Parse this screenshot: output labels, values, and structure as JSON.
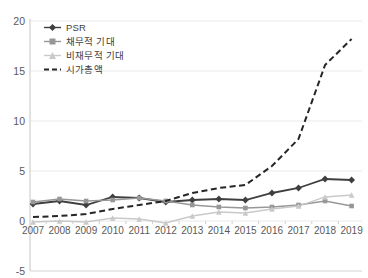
{
  "chart_data": {
    "type": "line",
    "title": "",
    "xlabel": "",
    "ylabel": "",
    "x": [
      2007,
      2008,
      2009,
      2010,
      2011,
      2012,
      2013,
      2014,
      2015,
      2016,
      2017,
      2018,
      2019
    ],
    "series": [
      {
        "name": "PSR",
        "marker": "diamond",
        "line_style": "solid",
        "color": "#3f3f3f",
        "values": [
          1.7,
          2.0,
          1.6,
          2.4,
          2.3,
          1.9,
          2.1,
          2.2,
          2.1,
          2.8,
          3.3,
          4.2,
          4.1
        ]
      },
      {
        "name": "채무적 기대",
        "marker": "square",
        "line_style": "solid",
        "color": "#979797",
        "values": [
          1.9,
          2.2,
          2.0,
          2.1,
          2.3,
          2.0,
          1.6,
          1.4,
          1.3,
          1.4,
          1.6,
          2.0,
          1.5
        ]
      },
      {
        "name": "비재무적 기대",
        "marker": "triangle",
        "line_style": "solid",
        "color": "#c9c9c9",
        "values": [
          -0.1,
          0.0,
          -0.1,
          0.3,
          0.2,
          -0.2,
          0.5,
          0.9,
          0.8,
          1.2,
          1.5,
          2.4,
          2.6
        ]
      },
      {
        "name": "시가총액",
        "marker": "none",
        "line_style": "dashed",
        "color": "#262626",
        "values": [
          0.4,
          0.5,
          0.7,
          1.2,
          1.6,
          2.0,
          2.8,
          3.3,
          3.6,
          5.5,
          8.2,
          15.6,
          18.2
        ]
      }
    ],
    "ylim": [
      -5,
      20
    ],
    "yticks": [
      -5,
      0,
      5,
      10,
      15,
      20
    ],
    "grid": true,
    "legend_position": "top-left",
    "colors": {
      "grid_line": "#e9e9e9",
      "bottom_line": "#d4d4d4",
      "axis_line": "#c6c6c6",
      "tick_label": "#595959"
    }
  }
}
